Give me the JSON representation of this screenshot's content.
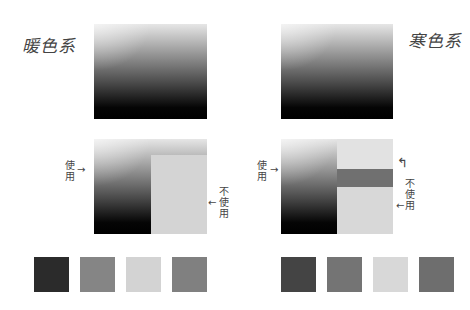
{
  "warm": {
    "title": "暖色系",
    "use_label": "使用",
    "not_use_label": "不使用",
    "arrow_right": "→",
    "arrow_left": "←",
    "panel_color": "#d4d4d4",
    "swatches": [
      "#2b2b2b",
      "#858585",
      "#d3d3d3",
      "#808080"
    ]
  },
  "cool": {
    "title": "寒色系",
    "use_label": "使用",
    "not_use_label": "不使用",
    "arrow_right": "→",
    "arrow_left": "←",
    "arrow_curve": "↰",
    "panel_color": "#dadada",
    "bar_color": "#707070",
    "swatches": [
      "#444444",
      "#747474",
      "#d8d8d8",
      "#6e6e6e"
    ]
  }
}
